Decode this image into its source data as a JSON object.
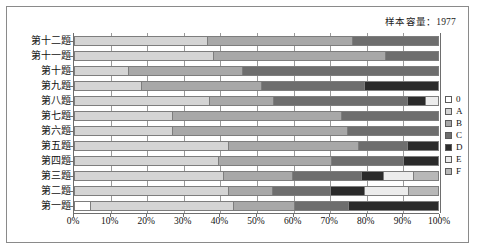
{
  "caption": "样本容量：1977",
  "legend": {
    "position": "right",
    "items": [
      {
        "label": "0",
        "color": "#ffffff"
      },
      {
        "label": "A",
        "color": "#d4d4d4"
      },
      {
        "label": "B",
        "color": "#a8a8a8"
      },
      {
        "label": "C",
        "color": "#6e6e6e"
      },
      {
        "label": "D",
        "color": "#2b2b2b"
      },
      {
        "label": "E",
        "color": "#ececec"
      },
      {
        "label": "F",
        "color": "#b8b8b8"
      }
    ]
  },
  "chart_data": {
    "type": "bar",
    "orientation": "horizontal",
    "stacked": true,
    "normalized": true,
    "title": "",
    "subtitle": "样本容量：1977",
    "xlabel": "",
    "ylabel": "",
    "xlim": [
      0,
      100
    ],
    "grid": true,
    "xticks": [
      "0%",
      "10%",
      "20%",
      "30%",
      "40%",
      "50%",
      "60%",
      "70%",
      "80%",
      "90%",
      "100%"
    ],
    "xtick_values": [
      0,
      10,
      20,
      30,
      40,
      50,
      60,
      70,
      80,
      90,
      100
    ],
    "categories": [
      "第十二题",
      "第十一题",
      "第十题",
      "第九题",
      "第八题",
      "第七题",
      "第六题",
      "第五题",
      "第四题",
      "第三题",
      "第二题",
      "第一题"
    ],
    "series": [
      {
        "name": "0",
        "color": "#ffffff",
        "values": [
          0,
          0,
          0,
          0,
          0,
          0,
          0,
          0,
          0,
          0,
          0,
          4.6
        ]
      },
      {
        "name": "A",
        "color": "#d4d4d4",
        "values": [
          36.8,
          38.4,
          15.0,
          18.6,
          37.3,
          27.2,
          27.0,
          42.5,
          39.8,
          41.2,
          42.4,
          39.1
        ]
      },
      {
        "name": "B",
        "color": "#a8a8a8",
        "values": [
          39.5,
          47.0,
          31.2,
          33.0,
          17.5,
          46.3,
          48.0,
          35.5,
          30.8,
          18.8,
          12.1,
          16.8
        ]
      },
      {
        "name": "C",
        "color": "#6e6e6e",
        "values": [
          23.7,
          14.6,
          53.8,
          28.0,
          36.8,
          26.5,
          25.0,
          13.6,
          19.8,
          18.9,
          15.8,
          14.9
        ]
      },
      {
        "name": "D",
        "color": "#2b2b2b",
        "values": [
          0,
          0,
          0,
          20.4,
          4.7,
          0,
          0,
          8.4,
          9.6,
          6.0,
          9.3,
          24.6
        ]
      },
      {
        "name": "E",
        "color": "#ececec",
        "values": [
          0,
          0,
          0,
          0,
          3.7,
          0,
          0,
          0,
          0,
          8.2,
          12.2,
          0
        ]
      },
      {
        "name": "F",
        "color": "#b8b8b8",
        "values": [
          0,
          0,
          0,
          0,
          0,
          0,
          0,
          0,
          0,
          6.9,
          8.2,
          0
        ]
      }
    ],
    "bars": [
      {
        "category": "第十二题",
        "segments": [
          {
            "series": "A",
            "value": 36.8,
            "color": "#d4d4d4"
          },
          {
            "series": "B",
            "value": 39.5,
            "color": "#a8a8a8"
          },
          {
            "series": "C",
            "value": 23.7,
            "color": "#6e6e6e"
          }
        ]
      },
      {
        "category": "第十一题",
        "segments": [
          {
            "series": "A",
            "value": 38.4,
            "color": "#d4d4d4"
          },
          {
            "series": "B",
            "value": 47.0,
            "color": "#a8a8a8"
          },
          {
            "series": "C",
            "value": 14.6,
            "color": "#6e6e6e"
          }
        ]
      },
      {
        "category": "第十题",
        "segments": [
          {
            "series": "A",
            "value": 15.0,
            "color": "#d4d4d4"
          },
          {
            "series": "B",
            "value": 31.2,
            "color": "#a8a8a8"
          },
          {
            "series": "C",
            "value": 53.8,
            "color": "#6e6e6e"
          }
        ]
      },
      {
        "category": "第九题",
        "segments": [
          {
            "series": "A",
            "value": 18.6,
            "color": "#d4d4d4"
          },
          {
            "series": "B",
            "value": 33.0,
            "color": "#a8a8a8"
          },
          {
            "series": "C",
            "value": 28.0,
            "color": "#6e6e6e"
          },
          {
            "series": "D",
            "value": 20.4,
            "color": "#2b2b2b"
          }
        ]
      },
      {
        "category": "第八题",
        "segments": [
          {
            "series": "A",
            "value": 37.3,
            "color": "#d4d4d4"
          },
          {
            "series": "B",
            "value": 17.5,
            "color": "#a8a8a8"
          },
          {
            "series": "C",
            "value": 36.8,
            "color": "#6e6e6e"
          },
          {
            "series": "D",
            "value": 4.7,
            "color": "#2b2b2b"
          },
          {
            "series": "E",
            "value": 3.7,
            "color": "#ececec"
          }
        ]
      },
      {
        "category": "第七题",
        "segments": [
          {
            "series": "A",
            "value": 27.2,
            "color": "#d4d4d4"
          },
          {
            "series": "B",
            "value": 46.3,
            "color": "#a8a8a8"
          },
          {
            "series": "C",
            "value": 26.5,
            "color": "#6e6e6e"
          }
        ]
      },
      {
        "category": "第六题",
        "segments": [
          {
            "series": "A",
            "value": 27.0,
            "color": "#d4d4d4"
          },
          {
            "series": "B",
            "value": 48.0,
            "color": "#a8a8a8"
          },
          {
            "series": "C",
            "value": 25.0,
            "color": "#6e6e6e"
          }
        ]
      },
      {
        "category": "第五题",
        "segments": [
          {
            "series": "A",
            "value": 42.5,
            "color": "#d4d4d4"
          },
          {
            "series": "B",
            "value": 35.5,
            "color": "#a8a8a8"
          },
          {
            "series": "C",
            "value": 13.6,
            "color": "#6e6e6e"
          },
          {
            "series": "D",
            "value": 8.4,
            "color": "#2b2b2b"
          }
        ]
      },
      {
        "category": "第四题",
        "segments": [
          {
            "series": "A",
            "value": 39.8,
            "color": "#d4d4d4"
          },
          {
            "series": "B",
            "value": 30.8,
            "color": "#a8a8a8"
          },
          {
            "series": "C",
            "value": 19.8,
            "color": "#6e6e6e"
          },
          {
            "series": "D",
            "value": 9.6,
            "color": "#2b2b2b"
          }
        ]
      },
      {
        "category": "第三题",
        "segments": [
          {
            "series": "A",
            "value": 41.2,
            "color": "#d4d4d4"
          },
          {
            "series": "B",
            "value": 18.8,
            "color": "#a8a8a8"
          },
          {
            "series": "C",
            "value": 18.9,
            "color": "#6e6e6e"
          },
          {
            "series": "D",
            "value": 6.0,
            "color": "#2b2b2b"
          },
          {
            "series": "E",
            "value": 8.2,
            "color": "#ececec"
          },
          {
            "series": "F",
            "value": 6.9,
            "color": "#b8b8b8"
          }
        ]
      },
      {
        "category": "第二题",
        "segments": [
          {
            "series": "A",
            "value": 42.4,
            "color": "#d4d4d4"
          },
          {
            "series": "B",
            "value": 12.1,
            "color": "#a8a8a8"
          },
          {
            "series": "C",
            "value": 15.8,
            "color": "#6e6e6e"
          },
          {
            "series": "D",
            "value": 9.3,
            "color": "#2b2b2b"
          },
          {
            "series": "E",
            "value": 12.2,
            "color": "#ececec"
          },
          {
            "series": "F",
            "value": 8.2,
            "color": "#b8b8b8"
          }
        ]
      },
      {
        "category": "第一题",
        "segments": [
          {
            "series": "0",
            "value": 4.6,
            "color": "#ffffff"
          },
          {
            "series": "A",
            "value": 39.1,
            "color": "#d4d4d4"
          },
          {
            "series": "B",
            "value": 16.8,
            "color": "#a8a8a8"
          },
          {
            "series": "C",
            "value": 14.9,
            "color": "#6e6e6e"
          },
          {
            "series": "D",
            "value": 24.6,
            "color": "#2b2b2b"
          }
        ]
      }
    ]
  }
}
